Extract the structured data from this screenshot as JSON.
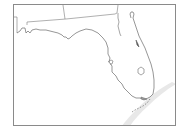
{
  "map": {
    "title": "Florida",
    "region": "Florida",
    "colors": {
      "background": "#ffffff",
      "frame": "#8a8a8a",
      "outline": "#6a6a6a",
      "border": "#7a7a7a",
      "highlight_band": "#e6e6e6"
    },
    "features": [
      {
        "name": "state-outline-florida"
      },
      {
        "name": "state-border-alabama"
      },
      {
        "name": "state-border-georgia"
      },
      {
        "name": "lake-okeechobee"
      },
      {
        "name": "florida-keys"
      }
    ]
  }
}
